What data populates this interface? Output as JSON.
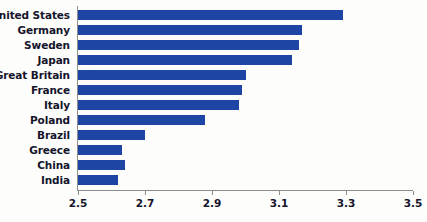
{
  "chart_data": {
    "type": "bar",
    "orientation": "horizontal",
    "title": "",
    "xlabel": "",
    "ylabel": "",
    "xlim": [
      2.5,
      3.5
    ],
    "xticks": [
      "2.5",
      "2.7",
      "2.9",
      "3.1",
      "3.3",
      "3.5"
    ],
    "xtick_values": [
      2.5,
      2.7,
      2.9,
      3.1,
      3.3,
      3.5
    ],
    "grid": false,
    "legend": false,
    "bar_color": "#1e45a4",
    "axis_color": "#8d8d8d",
    "label_color": "#14142b",
    "categories": [
      "United States",
      "Germany",
      "Sweden",
      "Japan",
      "Great Britain",
      "France",
      "Italy",
      "Poland",
      "Brazil",
      "Greece",
      "China",
      "India"
    ],
    "values": [
      3.29,
      3.17,
      3.16,
      3.14,
      3.0,
      2.99,
      2.98,
      2.88,
      2.7,
      2.63,
      2.64,
      2.62
    ]
  }
}
